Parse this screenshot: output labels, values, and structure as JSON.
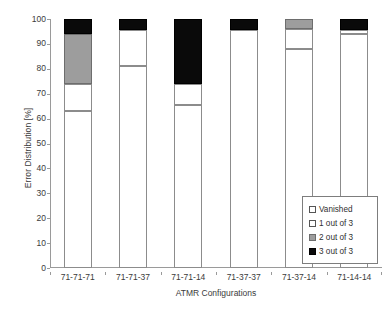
{
  "chart_data": {
    "type": "bar",
    "stacked": true,
    "title": "",
    "xlabel": "ATMR Configurations",
    "ylabel": "Error Distribution [%]",
    "ylim": [
      0,
      100
    ],
    "ytick_step": 10,
    "ytick_labels": [
      "100",
      "90",
      "80",
      "70",
      "60",
      "50",
      "40",
      "30",
      "20",
      "10",
      "0"
    ],
    "ytick_values": [
      100,
      90,
      80,
      70,
      60,
      50,
      40,
      30,
      20,
      10,
      0
    ],
    "grid": false,
    "legend_position": "lower-right-inside",
    "categories": [
      "71-71-71",
      "71-71-37",
      "71-71-14",
      "71-37-37",
      "71-37-14",
      "71-14-14"
    ],
    "series": [
      {
        "name": "Vanished",
        "color": "#ffffff",
        "values": [
          63.0,
          81.0,
          65.5,
          95.5,
          88.0,
          94.0
        ]
      },
      {
        "name": "1 out of 3",
        "color": "#ffffff",
        "values": [
          11.0,
          14.5,
          8.5,
          0.0,
          8.0,
          1.5
        ]
      },
      {
        "name": "2 out of 3",
        "color": "#9d9d9d",
        "values": [
          20.0,
          0.0,
          0.0,
          0.0,
          4.0,
          0.0
        ]
      },
      {
        "name": "3 out of 3",
        "color": "#0a0a0a",
        "values": [
          6.0,
          4.5,
          26.0,
          4.5,
          0.0,
          4.5
        ]
      }
    ]
  },
  "legend": {
    "items": [
      {
        "label": "Vanished"
      },
      {
        "label": "1 out of 3"
      },
      {
        "label": "2 out of 3"
      },
      {
        "label": "3 out of 3"
      }
    ]
  }
}
